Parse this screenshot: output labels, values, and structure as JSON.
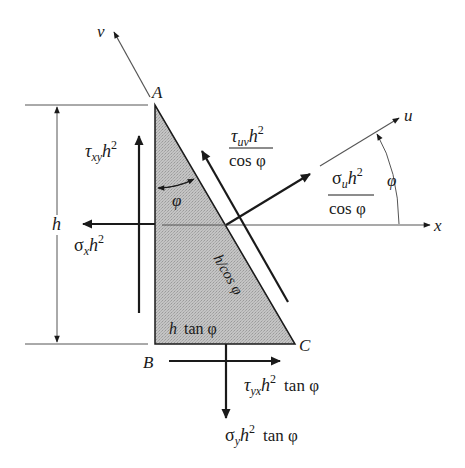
{
  "diagram": {
    "colors": {
      "ink": "#1a1a1a",
      "thin_line": "#555555",
      "fill": "#bdbdbd",
      "background": "#ffffff"
    },
    "vertices": {
      "A": "A",
      "B": "B",
      "C": "C"
    },
    "axes": {
      "u": "u",
      "v": "v",
      "x": "x"
    },
    "dimensions": {
      "height": "h",
      "hypotenuse": "h/cos φ",
      "base_h": "h",
      "base_tan": "tan φ"
    },
    "angles": {
      "inner_phi": "φ",
      "outer_phi": "φ"
    },
    "forces": {
      "tau_xy": {
        "sym": "τ",
        "sub": "xy",
        "var": "h",
        "sup": "2"
      },
      "sigma_x": {
        "sym": "σ",
        "sub": "x",
        "var": "h",
        "sup": "2"
      },
      "tau_uv": {
        "sym": "τ",
        "sub": "uv",
        "var": "h",
        "sup": "2",
        "den": "cos φ"
      },
      "sigma_u": {
        "sym": "σ",
        "sub": "u",
        "var": "h",
        "sup": "2",
        "den": "cos φ"
      },
      "tau_yx": {
        "sym": "τ",
        "sub": "yx",
        "var": "h",
        "sup": "2",
        "tail": "tan φ"
      },
      "sigma_y": {
        "sym": "σ",
        "sub": "y",
        "var": "h",
        "sup": "2",
        "tail": "tan φ"
      }
    }
  }
}
